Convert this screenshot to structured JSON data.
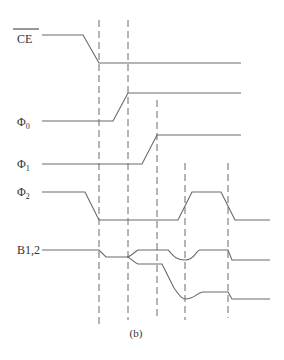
{
  "diagram": {
    "type": "timing-diagram",
    "caption": "(b)",
    "signals": [
      {
        "id": "ce",
        "label": "CE",
        "overline": true
      },
      {
        "id": "phi0",
        "label": "Φ",
        "subscript": "0"
      },
      {
        "id": "phi1",
        "label": "Φ",
        "subscript": "1"
      },
      {
        "id": "phi2",
        "label": "Φ",
        "subscript": "2"
      },
      {
        "id": "b12",
        "label": "B1,2"
      }
    ],
    "timing_markers": 5,
    "colors": {
      "line": "#6a6a6a",
      "text": "#333333",
      "background": "#ffffff"
    }
  }
}
